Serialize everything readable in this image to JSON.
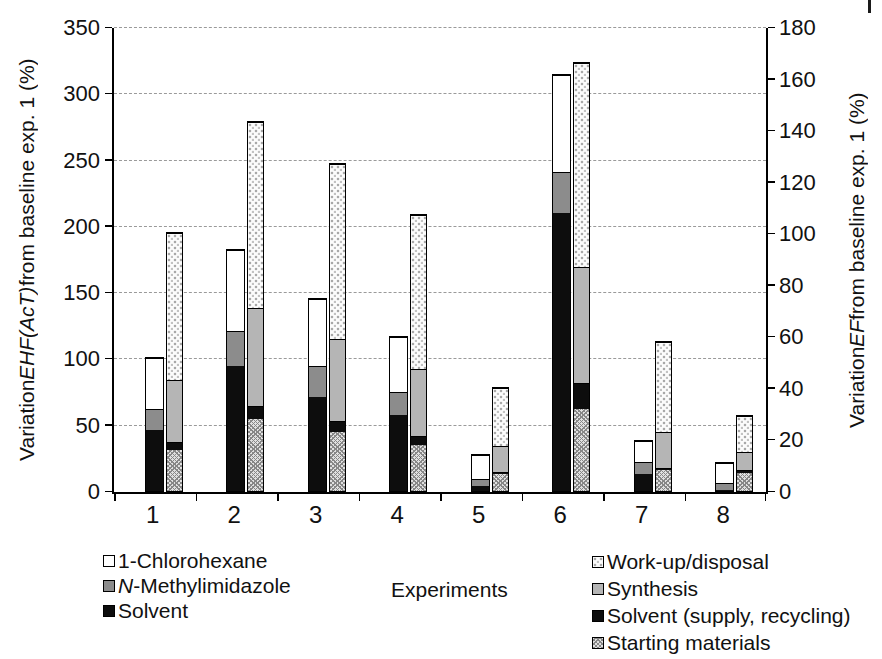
{
  "axes": {
    "left": {
      "title_pre": "Variation ",
      "title_em": "EHF(AcT)",
      "title_post": " from baseline exp. 1 (%)",
      "min": 0,
      "max": 350,
      "step": 50
    },
    "right": {
      "title_pre": "Variation ",
      "title_em": "EF",
      "title_post": " from baseline exp. 1 (%)",
      "min": 0,
      "max": 180,
      "step": 20
    },
    "x": {
      "label": "Experiments"
    }
  },
  "legend_left": {
    "items": [
      {
        "em": "",
        "label": "1-Chlorohexane",
        "fill": "white"
      },
      {
        "em": "N",
        "label": "-Methylimidazole",
        "fill": "gray-mid"
      },
      {
        "em": "",
        "label": "Solvent",
        "fill": "black"
      }
    ]
  },
  "legend_right": {
    "items": [
      {
        "em": "",
        "label": "Work-up/disposal",
        "fill": "dots"
      },
      {
        "em": "",
        "label": "Synthesis",
        "fill": "gray-light"
      },
      {
        "em": "",
        "label": "Solvent (supply, recycling)",
        "fill": "black"
      },
      {
        "em": "",
        "label": "Starting materials",
        "fill": "hatch"
      }
    ]
  },
  "colors": {
    "black": "#0d0d0d",
    "gray-mid": "#8c8c8c",
    "gray-light": "#b5b5b5",
    "white": "#ffffff",
    "grid": "#9a9a9a"
  },
  "chart_data": {
    "type": "bar",
    "variant": "grouped-stacked-dual-axis",
    "title": "",
    "xlabel": "Experiments",
    "categories": [
      "1",
      "2",
      "3",
      "4",
      "5",
      "6",
      "7",
      "8"
    ],
    "left_axis": {
      "label": "Variation EHF(AcT) from baseline exp. 1 (%)",
      "range": [
        0,
        350
      ],
      "tick_step": 50
    },
    "right_axis": {
      "label": "Variation EF from baseline exp. 1 (%)",
      "range": [
        0,
        180
      ],
      "tick_step": 20
    },
    "grid": "horizontal-dashed",
    "legend_position": "bottom",
    "bars_per_category": [
      {
        "name": "EHF(AcT)",
        "axis": "left"
      },
      {
        "name": "EF",
        "axis": "right"
      }
    ],
    "series": [
      {
        "bar": "EHF(AcT)",
        "axis": "left",
        "name": "Solvent",
        "fill": "black",
        "values": [
          46,
          94,
          71,
          57,
          4,
          210,
          13,
          1
        ]
      },
      {
        "bar": "EHF(AcT)",
        "axis": "left",
        "name": "N-Methylimidazole",
        "fill": "gray-mid",
        "values": [
          16,
          27,
          23,
          18,
          5,
          31,
          9,
          5
        ]
      },
      {
        "bar": "EHF(AcT)",
        "axis": "left",
        "name": "1-Chlorohexane",
        "fill": "white",
        "values": [
          38,
          61,
          51,
          41,
          18,
          73,
          16,
          15
        ]
      },
      {
        "bar": "EF",
        "axis": "right",
        "name": "Starting materials",
        "fill": "hatch",
        "values": [
          16,
          28,
          23,
          18,
          6.5,
          32,
          8,
          7
        ]
      },
      {
        "bar": "EF",
        "axis": "right",
        "name": "Solvent (supply, recycling)",
        "fill": "black",
        "values": [
          3,
          5,
          4,
          3.5,
          1,
          10,
          1,
          1
        ]
      },
      {
        "bar": "EF",
        "axis": "right",
        "name": "Synthesis",
        "fill": "gray-light",
        "values": [
          24,
          38,
          32,
          26,
          10,
          45,
          14,
          7
        ]
      },
      {
        "bar": "EF",
        "axis": "right",
        "name": "Work-up/disposal",
        "fill": "dots",
        "values": [
          57,
          72,
          68,
          59.5,
          22.5,
          79,
          35,
          14
        ]
      }
    ],
    "stack_totals": {
      "EHF(AcT)": [
        100,
        182,
        145,
        116,
        27,
        314,
        38,
        21
      ],
      "EF": [
        100,
        143,
        127,
        107,
        40,
        166,
        58,
        29
      ]
    }
  }
}
